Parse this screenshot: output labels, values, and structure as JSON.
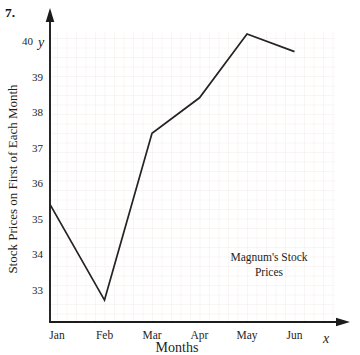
{
  "figure": {
    "problem_number": "7."
  },
  "chart_data": {
    "type": "line",
    "title": "Magnum's Stock Prices",
    "annotation_lines": [
      "Magnum's Stock",
      "Prices"
    ],
    "annotation_position": "lower-right inside plot",
    "categories": [
      "Jan",
      "Feb",
      "Mar",
      "Apr",
      "May",
      "Jun"
    ],
    "values": [
      35.4,
      32.7,
      37.4,
      38.4,
      40.2,
      39.7
    ],
    "xlabel": "Months",
    "ylabel": "Stock Prices on First of Each Month",
    "x_var": "x",
    "y_var": "y",
    "yticks": [
      40,
      39,
      38,
      37,
      36,
      35,
      34,
      33
    ],
    "ylim": [
      32,
      41
    ],
    "grid": true,
    "legend": "none",
    "line_color": "#242424",
    "grid_color": "#f1ebea",
    "axis_color": "#1c1c1c"
  }
}
